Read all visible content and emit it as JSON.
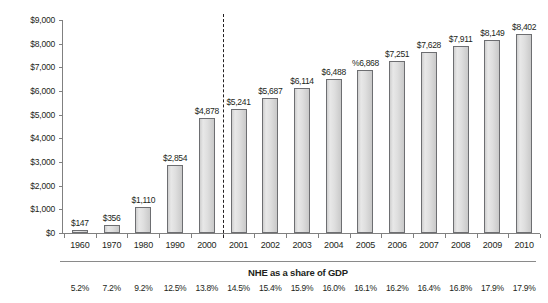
{
  "chart_data": {
    "type": "bar",
    "title": "",
    "subtitle": "",
    "xlabel": "",
    "ylabel": "",
    "ylim": [
      0,
      9000
    ],
    "grid": false,
    "legend": "none",
    "categories": [
      "1960",
      "1970",
      "1980",
      "1990",
      "2000",
      "2001",
      "2002",
      "2003",
      "2004",
      "2005",
      "2006",
      "2007",
      "2008",
      "2009",
      "2010"
    ],
    "values": [
      147,
      356,
      1110,
      2854,
      4878,
      5241,
      5687,
      6114,
      6488,
      6868,
      7251,
      7628,
      7911,
      8149,
      8402
    ],
    "value_labels": [
      "$147",
      "$356",
      "$1,110",
      "$2,854",
      "$4,878",
      "$5,241",
      "$5,687",
      "$6,114",
      "$6,488",
      "%6,868",
      "$7,251",
      "$7,628",
      "$7,911",
      "$8,149",
      "$8,402"
    ],
    "y_ticks": [
      0,
      1000,
      2000,
      3000,
      4000,
      5000,
      6000,
      7000,
      8000,
      9000
    ],
    "y_tick_labels": [
      "$0",
      "$1,000",
      "$2,000",
      "$3,000",
      "$4,000",
      "$5,000",
      "$6,000",
      "$7,000",
      "$8,000",
      "$9,000"
    ],
    "annotations": [
      {
        "name": "projection-divider",
        "type": "vline",
        "between": [
          "2000",
          "2001"
        ],
        "style": "dashed"
      }
    ],
    "secondary_table": {
      "title": "NHE as a share of GDP",
      "values": [
        "5.2%",
        "7.2%",
        "9.2%",
        "12.5%",
        "13.8%",
        "14.5%",
        "15.4%",
        "15.9%",
        "16.0%",
        "16.1%",
        "16.2%",
        "16.4%",
        "16.8%",
        "17.9%",
        "17.9%"
      ]
    },
    "colors": {
      "bar_fill": "#dedede",
      "bar_border": "#6d6e71",
      "axis": "#808080",
      "text": "#231f20"
    }
  }
}
